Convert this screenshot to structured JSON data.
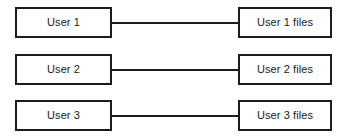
{
  "diagram": {
    "type": "mapping-diagram",
    "background_color": "#ffffff",
    "line_color": "#1c1c1c",
    "border_color": "#1c1c1c",
    "text_color": "#1a1a1a",
    "rows": [
      {
        "source_label": "User 1",
        "target_label": "User 1 files",
        "connector": "line"
      },
      {
        "source_label": "User 2",
        "target_label": "User 2 files",
        "connector": "line"
      },
      {
        "source_label": "User 3",
        "target_label": "User 3 files",
        "connector": "line"
      }
    ]
  }
}
